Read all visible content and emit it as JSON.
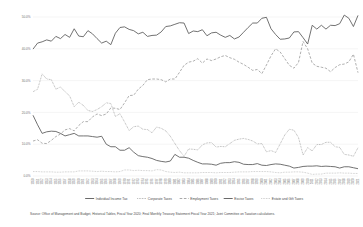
{
  "chart_data": {
    "type": "line",
    "title": "",
    "subtitle": "",
    "xlabel": "",
    "ylabel": "",
    "ylim": [
      0,
      50
    ],
    "grid": true,
    "legend_position": "bottom",
    "ytick_labels": [
      "50.0%",
      "40.0%",
      "30.0%",
      "20.0%",
      "10.0%",
      "0.0%"
    ],
    "ytick_values": [
      50,
      40,
      30,
      20,
      10,
      0
    ],
    "x": [
      "1950",
      "1951",
      "1952",
      "1953",
      "1954",
      "1955",
      "1956",
      "1957",
      "1958",
      "1959",
      "1960",
      "1961",
      "1962",
      "1963",
      "1964",
      "1965",
      "1966",
      "1967",
      "1968",
      "1969",
      "1970",
      "1971",
      "1972",
      "1973",
      "1974",
      "1975",
      "1976",
      "1977",
      "1978",
      "1979",
      "1980",
      "1981",
      "1982",
      "1983",
      "1984",
      "1985",
      "1986",
      "1987",
      "1988",
      "1989",
      "1990",
      "1991",
      "1992",
      "1993",
      "1994",
      "1995",
      "1996",
      "1997",
      "1998",
      "1999",
      "2000",
      "2001",
      "2002",
      "2003",
      "2004",
      "2005",
      "2006",
      "2007",
      "2008",
      "2009",
      "2010",
      "2011",
      "2012",
      "2013",
      "2014",
      "2015",
      "2016",
      "2017",
      "2018",
      "2019",
      "2020",
      "2021"
    ],
    "series": [
      {
        "name": "Individual Income Tax",
        "style": "solid",
        "color": "#595959",
        "values": [
          39.9,
          41.8,
          42.2,
          42.8,
          42.4,
          43.9,
          43.2,
          44.5,
          43.6,
          46.3,
          44.0,
          43.8,
          45.7,
          44.7,
          43.2,
          41.8,
          42.4,
          41.3,
          44.9,
          46.7,
          46.9,
          46.1,
          45.7,
          44.7,
          45.2,
          43.9,
          44.2,
          44.3,
          45.3,
          47.0,
          47.2,
          47.7,
          48.2,
          48.1,
          44.8,
          45.6,
          45.4,
          46.0,
          44.1,
          45.0,
          45.2,
          44.3,
          43.6,
          44.2,
          43.1,
          43.7,
          45.2,
          46.7,
          48.1,
          48.1,
          49.6,
          49.9,
          46.3,
          44.5,
          43.0,
          43.1,
          43.4,
          45.3,
          45.4,
          43.5,
          41.5,
          47.4,
          46.2,
          47.4,
          46.2,
          47.4,
          47.3,
          47.9,
          50.6,
          49.6,
          47.0,
          50.5
        ]
      },
      {
        "name": "Corporate Taxes",
        "style": "dotted",
        "color": "#8c8c8c",
        "values": [
          26.5,
          27.3,
          32.1,
          30.5,
          30.3,
          27.3,
          28.0,
          26.5,
          25.2,
          21.8,
          23.2,
          22.2,
          20.6,
          20.3,
          20.9,
          21.8,
          23.0,
          22.8,
          18.7,
          19.6,
          17.0,
          14.3,
          15.5,
          15.7,
          14.7,
          14.6,
          13.6,
          15.4,
          15.0,
          14.2,
          12.5,
          10.2,
          8.0,
          6.2,
          8.5,
          8.4,
          8.2,
          9.8,
          10.4,
          10.5,
          9.1,
          9.3,
          9.2,
          10.2,
          11.2,
          11.6,
          11.8,
          11.5,
          11.0,
          10.1,
          10.2,
          7.6,
          8.0,
          7.4,
          10.1,
          12.9,
          14.7,
          14.4,
          12.1,
          6.6,
          8.9,
          7.9,
          9.9,
          9.9,
          10.6,
          10.6,
          9.2,
          9.0,
          6.8,
          6.6,
          6.2,
          8.9
        ]
      },
      {
        "name": "Employment Taxes",
        "style": "dashed",
        "color": "#8c8c8c",
        "values": [
          11.0,
          11.4,
          10.3,
          10.2,
          11.2,
          12.4,
          13.2,
          14.5,
          14.9,
          14.2,
          15.9,
          17.1,
          17.1,
          18.6,
          19.5,
          19.0,
          19.5,
          21.4,
          21.3,
          20.9,
          23.0,
          25.3,
          25.4,
          27.3,
          28.5,
          30.3,
          30.5,
          30.5,
          30.3,
          29.6,
          30.5,
          30.5,
          32.6,
          34.8,
          35.8,
          36.1,
          36.9,
          35.5,
          36.8,
          36.3,
          36.8,
          37.5,
          37.9,
          37.2,
          36.7,
          35.8,
          35.1,
          34.2,
          33.2,
          33.5,
          32.2,
          34.9,
          37.8,
          40.0,
          39.0,
          36.9,
          34.8,
          33.9,
          35.7,
          42.3,
          40.0,
          35.5,
          34.5,
          34.2,
          33.9,
          32.8,
          34.1,
          35.0,
          35.2,
          35.9,
          38.3,
          32.5
        ]
      },
      {
        "name": "Excise Taxes",
        "style": "solid",
        "color": "#595959",
        "values": [
          19.1,
          16.1,
          13.4,
          13.9,
          14.1,
          14.0,
          13.4,
          12.6,
          13.0,
          13.4,
          12.6,
          12.6,
          12.6,
          12.4,
          12.2,
          12.5,
          10.0,
          9.2,
          9.2,
          8.1,
          8.1,
          8.9,
          7.5,
          6.4,
          6.1,
          5.9,
          5.5,
          4.9,
          4.6,
          4.4,
          4.7,
          6.8,
          5.9,
          5.9,
          5.6,
          4.9,
          4.3,
          3.8,
          3.8,
          3.7,
          3.4,
          4.0,
          4.2,
          4.2,
          4.5,
          4.3,
          3.7,
          3.6,
          3.6,
          3.9,
          3.4,
          3.3,
          3.6,
          3.8,
          3.7,
          3.4,
          3.1,
          2.5,
          2.7,
          3.0,
          3.1,
          3.1,
          3.2,
          3.0,
          3.1,
          3.0,
          2.9,
          2.5,
          2.9,
          2.9,
          2.6,
          2.3
        ]
      },
      {
        "name": "Estate and Gift Taxes",
        "style": "dotted",
        "color": "#b0b0b0",
        "values": [
          1.4,
          1.4,
          1.3,
          1.3,
          1.3,
          1.2,
          1.2,
          1.3,
          1.3,
          1.3,
          1.6,
          1.6,
          1.6,
          1.5,
          1.4,
          1.5,
          1.4,
          1.4,
          1.3,
          1.4,
          1.9,
          1.9,
          1.7,
          1.8,
          1.7,
          1.7,
          1.6,
          2.0,
          1.9,
          1.4,
          1.2,
          1.1,
          1.2,
          1.0,
          1.0,
          1.0,
          1.0,
          1.1,
          1.1,
          1.1,
          1.0,
          1.1,
          1.1,
          1.1,
          1.2,
          1.3,
          1.3,
          1.3,
          1.4,
          1.4,
          1.4,
          1.4,
          1.3,
          1.1,
          1.0,
          1.2,
          1.2,
          1.3,
          1.3,
          1.2,
          0.9,
          0.5,
          0.6,
          0.6,
          0.9,
          0.9,
          0.9,
          1.0,
          0.9,
          0.9,
          0.8,
          0.8
        ]
      }
    ]
  },
  "legend": {
    "items": [
      {
        "label": "Individual Income Tax",
        "style": "solid",
        "color": "#595959"
      },
      {
        "label": "Corporate Taxes",
        "style": "dotted",
        "color": "#8c8c8c"
      },
      {
        "label": "Employment Taxes",
        "style": "dashed",
        "color": "#8c8c8c"
      },
      {
        "label": "Excise Taxes",
        "style": "solid",
        "color": "#595959"
      },
      {
        "label": "Estate and Gift Taxes",
        "style": "dotted",
        "color": "#b0b0b0"
      }
    ]
  },
  "footnote": {
    "source": "Source: Office of Management and Budget, Historical Tables, Fiscal Year 2020; Final Monthly Treasury Statement Fiscal Year 2021; Joint Committee on Taxation calculations."
  }
}
